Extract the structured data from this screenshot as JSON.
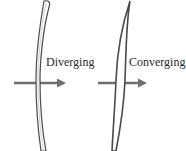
{
  "diagram": {
    "lenses": [
      {
        "type": "diverging",
        "label": "Diverging"
      },
      {
        "type": "converging",
        "label": "Converging"
      }
    ],
    "colors": {
      "lens_outline": "#4a4a4a",
      "lens_fill": "#ffffff",
      "arrow": "#6e6e6e",
      "text": "#2a2a2a"
    }
  }
}
